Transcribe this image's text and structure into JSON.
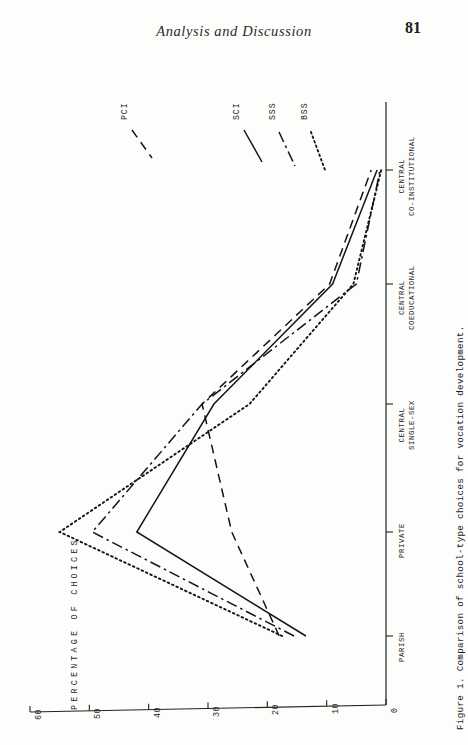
{
  "header": {
    "running_title": "Analysis and Discussion",
    "page_number": "81"
  },
  "figure": {
    "caption": "Figure 1. Comparison of school-type choices for vocation development.",
    "value_axis_title": "PERCENTAGE OF CHOICES",
    "value_axis_ticks": [
      "60",
      "50",
      "40",
      "30",
      "20",
      "10",
      "0"
    ],
    "category_labels": [
      {
        "line1": "PARISH",
        "line2": ""
      },
      {
        "line1": "PRIVATE",
        "line2": ""
      },
      {
        "line1": "CENTRAL",
        "line2": "SINGLE-SEX"
      },
      {
        "line1": "CENTRAL",
        "line2": "COEDUCATIONAL"
      },
      {
        "line1": "CENTRAL",
        "line2": "CO-INSTITUTIONAL"
      }
    ],
    "series_labels": [
      "PCI",
      "SCI",
      "SSS",
      "BSS"
    ],
    "line_color": "#141414"
  },
  "chart_data": {
    "type": "line",
    "title": "Comparison of school-type choices for vocation development.",
    "xlabel": "",
    "ylabel": "PERCENTAGE OF CHOICES",
    "orientation": "rotated-90",
    "categories": [
      "PARISH",
      "PRIVATE",
      "CENTRAL SINGLE-SEX",
      "CENTRAL COEDUCATIONAL",
      "CENTRAL CO-INSTITUTIONAL"
    ],
    "ylim": [
      0,
      60
    ],
    "yticks": [
      0,
      10,
      20,
      30,
      40,
      50,
      60
    ],
    "grid": false,
    "legend": "inline-end-labels",
    "series": [
      {
        "name": "PCI",
        "style": "dashed",
        "values": [
          18.0,
          26.0,
          31.0,
          9.5,
          2.5
        ]
      },
      {
        "name": "SCI",
        "style": "solid",
        "values": [
          13.5,
          42.0,
          29.0,
          9.0,
          1.5
        ]
      },
      {
        "name": "SSS",
        "style": "dashdot",
        "values": [
          15.5,
          49.5,
          31.0,
          5.0,
          1.0
        ]
      },
      {
        "name": "BSS",
        "style": "dotted",
        "values": [
          17.5,
          55.0,
          23.0,
          5.5,
          0.8
        ]
      }
    ]
  }
}
